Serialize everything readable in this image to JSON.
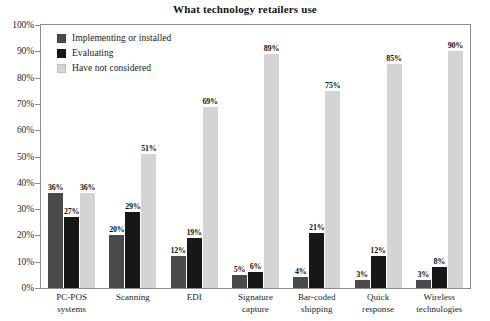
{
  "chart_data": {
    "type": "bar",
    "title": "What technology retailers use",
    "xlabel": "",
    "ylabel": "",
    "ylim": [
      0,
      100
    ],
    "ytick_labels": [
      "100%",
      "90%",
      "80%",
      "70%",
      "60%",
      "50%",
      "40%",
      "30%",
      "20%",
      "10%",
      "0%"
    ],
    "ytick_values": [
      100,
      90,
      80,
      70,
      60,
      50,
      40,
      30,
      20,
      10,
      0
    ],
    "grid": false,
    "legend_position": "inside-top-left",
    "categories": [
      "PC-POS systems",
      "Scanning",
      "EDI",
      "Signature capture",
      "Bar-coded shipping",
      "Quick response",
      "Wireless technologies"
    ],
    "category_lines": [
      [
        "PC-POS",
        "systems"
      ],
      [
        "Scanning"
      ],
      [
        "EDI"
      ],
      [
        "Signature",
        "capture"
      ],
      [
        "Bar-coded",
        "shipping"
      ],
      [
        "Quick",
        "response"
      ],
      [
        "Wireless",
        "technologies"
      ]
    ],
    "series": [
      {
        "name": "Implementing or installed",
        "color": "#4a4a4a",
        "values": [
          36,
          20,
          12,
          5,
          4,
          3,
          3
        ],
        "labels": [
          "36%",
          "20%",
          "12%",
          "5%",
          "4%",
          "3%",
          "3%"
        ]
      },
      {
        "name": "Evaluating",
        "color": "#171717",
        "values": [
          27,
          29,
          19,
          6,
          21,
          12,
          8
        ],
        "labels": [
          "27%",
          "29%",
          "19%",
          "6%",
          "21%",
          "12%",
          "8%"
        ]
      },
      {
        "name": "Have not considered",
        "color": "#d4d4d4",
        "values": [
          36,
          51,
          69,
          89,
          75,
          85,
          90
        ],
        "labels": [
          "36%",
          "51%",
          "69%",
          "89%",
          "75%",
          "85%",
          "90%"
        ]
      }
    ]
  },
  "legend": [
    {
      "label": "Implementing or installed",
      "color": "#4a4a4a"
    },
    {
      "label": "Evaluating",
      "color": "#171717"
    },
    {
      "label": "Have not considered",
      "color": "#d4d4d4"
    }
  ],
  "colors": {
    "axis": "#8c8c8c",
    "text": "#1a1a1a",
    "background": "#ffffff"
  }
}
